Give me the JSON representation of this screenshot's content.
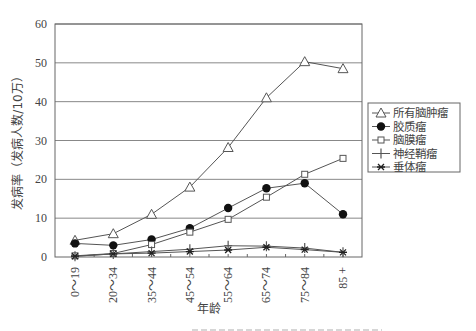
{
  "chart_data": {
    "type": "line",
    "title": "",
    "xlabel": "年龄",
    "ylabel": "发病率（发病人数/10万）",
    "ylim": [
      0,
      60
    ],
    "yticks": [
      0,
      10,
      20,
      30,
      40,
      50,
      60
    ],
    "grid": "horizontal",
    "legend_position": "right",
    "categories": [
      "0～19",
      "20～34",
      "35～44",
      "45～54",
      "55～64",
      "65～74",
      "75～84",
      "85 +"
    ],
    "series": [
      {
        "name": "所有脑肿瘤",
        "marker": "triangle-open",
        "values": [
          4.3,
          6.0,
          11.0,
          18.0,
          28.2,
          41.0,
          50.3,
          48.5
        ]
      },
      {
        "name": "胶质瘤",
        "marker": "circle-filled",
        "values": [
          3.5,
          3.0,
          4.5,
          7.4,
          12.6,
          17.7,
          19.0,
          11.0
        ]
      },
      {
        "name": "脑膜瘤",
        "marker": "square-open",
        "values": [
          0.3,
          0.9,
          3.2,
          6.4,
          9.7,
          15.4,
          21.3,
          25.4
        ]
      },
      {
        "name": "神经鞘瘤",
        "marker": "plus",
        "values": [
          0.2,
          0.8,
          1.4,
          2.0,
          2.9,
          2.8,
          2.3,
          1.2
        ]
      },
      {
        "name": "垂体瘤",
        "marker": "asterisk",
        "values": [
          0.2,
          0.8,
          1.0,
          1.4,
          1.8,
          2.5,
          1.9,
          1.2
        ]
      }
    ]
  },
  "colors": {
    "line": "#555555",
    "grid": "#888888",
    "axis": "#666666",
    "marker_fill": "#111111"
  }
}
